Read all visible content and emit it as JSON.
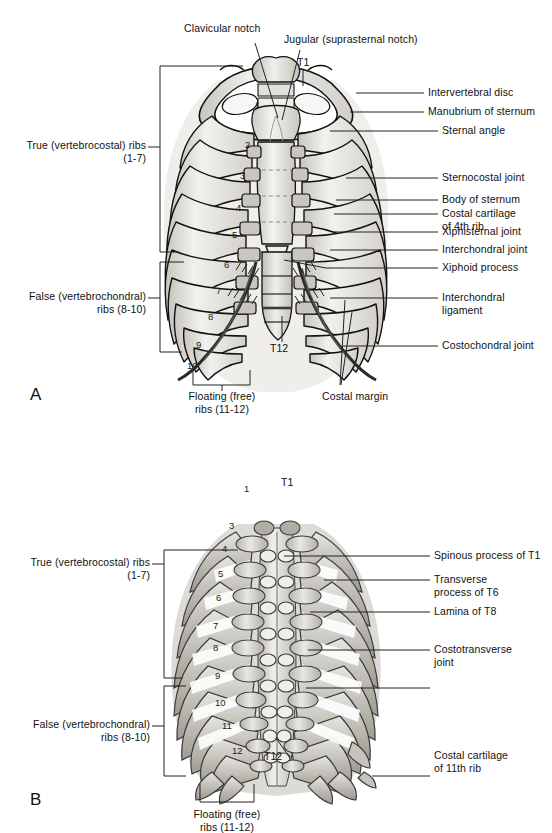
{
  "figure": {
    "panels": [
      {
        "id": "A",
        "letter": "A",
        "view": "anterior",
        "labels_top": [
          {
            "name": "clavicular-notch",
            "text": "Clavicular notch"
          },
          {
            "name": "jugular-notch",
            "text": "Jugular (suprasternal notch)"
          }
        ],
        "labels_right": [
          {
            "name": "intervertebral-disc",
            "text": "Intervertebral disc"
          },
          {
            "name": "manubrium-of-sternum",
            "text": "Manubrium of sternum"
          },
          {
            "name": "sternal-angle",
            "text": "Sternal angle"
          },
          {
            "name": "sternocostal-joint",
            "text": "Sternocostal joint"
          },
          {
            "name": "body-of-sternum",
            "text": "Body of sternum"
          },
          {
            "name": "costal-cartilage-4th-rib",
            "text": "Costal cartilage\nof 4th rib"
          },
          {
            "name": "xiphisternal-joint",
            "text": "Xiphisternal joint"
          },
          {
            "name": "interchondral-joint",
            "text": "Interchondral joint"
          },
          {
            "name": "xiphoid-process",
            "text": "Xiphoid process"
          },
          {
            "name": "interchondral-ligament",
            "text": "Interchondral\nligament"
          },
          {
            "name": "costochondral-joint",
            "text": "Costochondral joint"
          }
        ],
        "labels_left": [
          {
            "name": "true-ribs-bracket",
            "text": "True (vertebrocostal) ribs\n(1-7)"
          },
          {
            "name": "false-ribs-bracket",
            "text": "False (vertebrochondral)\nribs (8-10)"
          }
        ],
        "labels_bottom": [
          {
            "name": "floating-ribs-bracket",
            "text": "Floating (free)\nribs (11-12)"
          },
          {
            "name": "costal-margin",
            "text": "Costal margin"
          }
        ],
        "vertebra_labels": [
          {
            "name": "vertebra-t1",
            "text": "T1"
          },
          {
            "name": "vertebra-t12",
            "text": "T12"
          }
        ],
        "rib_numbers": [
          "1",
          "2",
          "3",
          "4",
          "5",
          "6",
          "7",
          "8",
          "9",
          "10"
        ]
      },
      {
        "id": "B",
        "letter": "B",
        "view": "posterior",
        "labels_right": [
          {
            "name": "spinous-process-t1",
            "text": "Spinous process of T1"
          },
          {
            "name": "transverse-process-t6",
            "text": "Transverse\nprocess of T6"
          },
          {
            "name": "lamina-of-t8",
            "text": "Lamina of T8"
          },
          {
            "name": "costotransverse-joint",
            "text": "Costotransverse\njoint"
          },
          {
            "name": "costal-cartilage-11th-rib",
            "text": "Costal cartilage\nof 11th rib"
          }
        ],
        "labels_left": [
          {
            "name": "true-ribs-bracket",
            "text": "True (vertebrocostal) ribs\n(1-7)"
          },
          {
            "name": "false-ribs-bracket",
            "text": "False (vertebrochondral)\nribs (8-10)"
          }
        ],
        "labels_bottom": [
          {
            "name": "floating-ribs-bracket",
            "text": "Floating (free)\nribs (11-12)"
          }
        ],
        "vertebra_labels": [
          {
            "name": "vertebra-t1",
            "text": "T1"
          },
          {
            "name": "vertebra-t12",
            "text": "T12"
          }
        ],
        "rib_numbers": [
          "1",
          "3",
          "4",
          "5",
          "6",
          "7",
          "8",
          "9",
          "10",
          "11",
          "12"
        ]
      }
    ]
  },
  "colors": {
    "background": "#ffffff",
    "outline": "#111111",
    "bone_light": "#f0efec",
    "bone_mid": "#d9d7d1",
    "bone_shade": "#b9b6ae",
    "bone_dark": "#9b978e",
    "cartilage": "#cfcdc6",
    "text": "#111111",
    "leader": "#222222"
  }
}
